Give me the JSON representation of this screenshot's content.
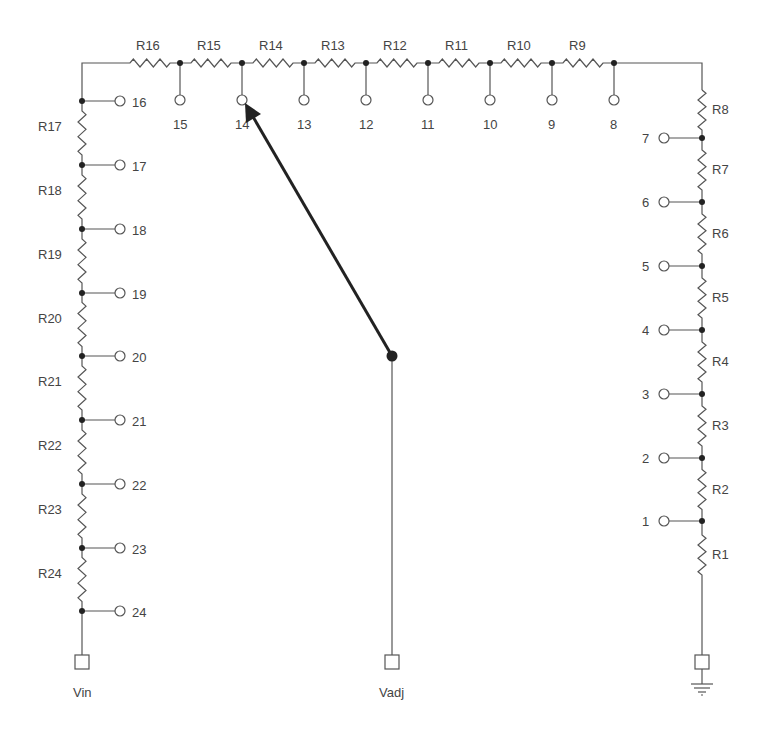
{
  "diagram": {
    "colors": {
      "wire": "#555555",
      "node": "#222222",
      "wiper": "#222222",
      "background": "#ffffff",
      "text": "#444444"
    },
    "top_resistors": [
      "R16",
      "R15",
      "R14",
      "R13",
      "R12",
      "R11",
      "R10",
      "R9"
    ],
    "top_taps": [
      "15",
      "14",
      "13",
      "12",
      "11",
      "10",
      "9",
      "8"
    ],
    "left_resistors": [
      "R17",
      "R18",
      "R19",
      "R20",
      "R21",
      "R22",
      "R23",
      "R24"
    ],
    "left_taps": [
      "16",
      "17",
      "18",
      "19",
      "20",
      "21",
      "22",
      "23",
      "24"
    ],
    "right_resistors": [
      "R8",
      "R7",
      "R6",
      "R5",
      "R4",
      "R3",
      "R2",
      "R1"
    ],
    "right_taps": [
      "7",
      "6",
      "5",
      "4",
      "3",
      "2",
      "1"
    ],
    "terminals": {
      "vin": "Vin",
      "vadj": "Vadj",
      "ground": "ground-symbol"
    },
    "wiper": {
      "selected_tap": "14",
      "pivot_terminal": "Vadj"
    }
  }
}
